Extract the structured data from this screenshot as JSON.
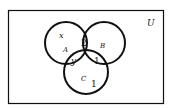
{
  "diagram": {
    "type": "venn",
    "universe_label": "U",
    "sets": [
      {
        "name": "A",
        "label": "A"
      },
      {
        "name": "B",
        "label": "B"
      },
      {
        "name": "C",
        "label": "C"
      }
    ],
    "regions": {
      "A_only": "x",
      "A_and_B_only": "2",
      "A_and_C_only": "y",
      "B_and_C_only": "1",
      "C_only": "1"
    }
  }
}
